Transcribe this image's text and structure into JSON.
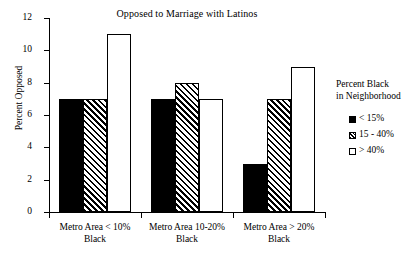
{
  "chart_data": {
    "type": "bar",
    "title": "Opposed to Marriage with Latinos",
    "xlabel": "",
    "ylabel": "Percent Opposed",
    "ylim": [
      0,
      12
    ],
    "yticks": [
      0,
      2,
      4,
      6,
      8,
      10,
      12
    ],
    "ytick_labels": [
      "0",
      "2",
      "4",
      "6",
      "8",
      "10",
      "12"
    ],
    "grid": false,
    "legend_position": "right",
    "legend_title": "Percent Black\nin Neighborhood",
    "legend_title_line1": "Percent Black",
    "legend_title_line2": "in Neighborhood",
    "categories": [
      "Metro Area < 10% Black",
      "Metro Area 10-20% Black",
      "Metro Area > 20% Black"
    ],
    "category_lines": [
      [
        "Metro Area < 10%",
        "Black"
      ],
      [
        "Metro Area 10-20%",
        "Black"
      ],
      [
        "Metro Area > 20%",
        "Black"
      ]
    ],
    "series": [
      {
        "name": "< 15%",
        "style": "solid",
        "values": [
          7,
          7,
          3
        ]
      },
      {
        "name": "15 - 40%",
        "style": "hatch",
        "values": [
          7,
          8,
          7
        ]
      },
      {
        "name": "> 40%",
        "style": "open",
        "values": [
          11,
          7,
          9
        ]
      }
    ],
    "colors": {
      "axis": "#000000",
      "text": "#000000",
      "background": "#ffffff",
      "series_solid": "#000000",
      "series_hatch": "#ffffff",
      "series_open": "#ffffff"
    }
  }
}
